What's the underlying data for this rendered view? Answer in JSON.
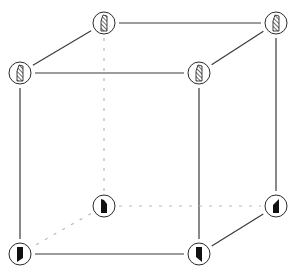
{
  "diagram": {
    "title": "",
    "type": "cube",
    "colors": {
      "background": "#ffffff",
      "edge": "#3a3a3a",
      "hidden_edge": "#b8b8b8",
      "node_stroke": "#2a2a2a",
      "glyph_fill": "#111111"
    },
    "nodes": [
      {
        "id": "back-top-left",
        "x": 104,
        "y": 23,
        "glyph": "hatched"
      },
      {
        "id": "back-top-right",
        "x": 276,
        "y": 23,
        "glyph": "hatched"
      },
      {
        "id": "front-top-left",
        "x": 20,
        "y": 73,
        "glyph": "hatched"
      },
      {
        "id": "front-top-right",
        "x": 199,
        "y": 73,
        "glyph": "hatched"
      },
      {
        "id": "back-bottom-left",
        "x": 104,
        "y": 206,
        "glyph": "solid"
      },
      {
        "id": "back-bottom-right",
        "x": 276,
        "y": 206,
        "glyph": "solid"
      },
      {
        "id": "front-bottom-left",
        "x": 20,
        "y": 254,
        "glyph": "solid"
      },
      {
        "id": "front-bottom-right",
        "x": 199,
        "y": 254,
        "glyph": "solid"
      }
    ],
    "edges": [
      {
        "from": "back-top-left",
        "to": "back-top-right",
        "style": "solid"
      },
      {
        "from": "front-top-left",
        "to": "front-top-right",
        "style": "solid"
      },
      {
        "from": "back-top-left",
        "to": "front-top-left",
        "style": "solid"
      },
      {
        "from": "back-top-right",
        "to": "front-top-right",
        "style": "solid"
      },
      {
        "from": "front-top-left",
        "to": "front-bottom-left",
        "style": "solid"
      },
      {
        "from": "front-top-right",
        "to": "front-bottom-right",
        "style": "solid"
      },
      {
        "from": "back-top-right",
        "to": "back-bottom-right",
        "style": "solid"
      },
      {
        "from": "front-bottom-left",
        "to": "front-bottom-right",
        "style": "solid"
      },
      {
        "from": "front-bottom-right",
        "to": "back-bottom-right",
        "style": "solid"
      },
      {
        "from": "back-top-left",
        "to": "back-bottom-left",
        "style": "dashed"
      },
      {
        "from": "back-bottom-left",
        "to": "back-bottom-right",
        "style": "dashed"
      },
      {
        "from": "back-bottom-left",
        "to": "front-bottom-left",
        "style": "dashed"
      }
    ]
  }
}
